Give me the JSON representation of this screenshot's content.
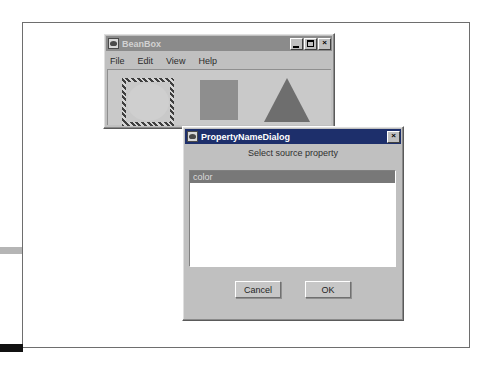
{
  "page": {
    "background": "#ffffff",
    "frame_color": "#6e6e6e",
    "margin_marks": [
      {
        "name": "gray-mark",
        "color": "#b5b5b5"
      },
      {
        "name": "black-mark",
        "color": "#111111"
      }
    ]
  },
  "beanbox_window": {
    "title": "BeanBox",
    "titlebar_color": "#8b8b8b",
    "title_text_color": "#d2d2d2",
    "icon": "beanbox-coffee-icon",
    "controls": [
      {
        "name": "minimize",
        "glyph": "_"
      },
      {
        "name": "maximize",
        "glyph": "□"
      },
      {
        "name": "close",
        "glyph": "×"
      }
    ],
    "menu": [
      {
        "label": "File"
      },
      {
        "label": "Edit"
      },
      {
        "label": "View"
      },
      {
        "label": "Help"
      }
    ],
    "canvas": {
      "background": "#c9c9c9",
      "shapes": [
        {
          "name": "circle-bean",
          "type": "circle",
          "color": "#cfcfcf",
          "selected": true
        },
        {
          "name": "square-bean",
          "type": "square",
          "color": "#8e8e8e",
          "selected": false
        },
        {
          "name": "triangle-bean",
          "type": "triangle",
          "color": "#6e6e6e",
          "selected": false
        }
      ]
    }
  },
  "dialog": {
    "title": "PropertyNameDialog",
    "titlebar_color": "#1d2f6b",
    "title_text_color": "#ffffff",
    "icon": "beanbox-coffee-icon",
    "close_glyph": "×",
    "prompt": "Select source property",
    "list": {
      "items": [
        {
          "label": "color",
          "selected": true
        }
      ],
      "selection_color": "#787878",
      "background": "#ffffff"
    },
    "buttons": [
      {
        "name": "cancel",
        "label": "Cancel"
      },
      {
        "name": "ok",
        "label": "OK"
      }
    ]
  }
}
